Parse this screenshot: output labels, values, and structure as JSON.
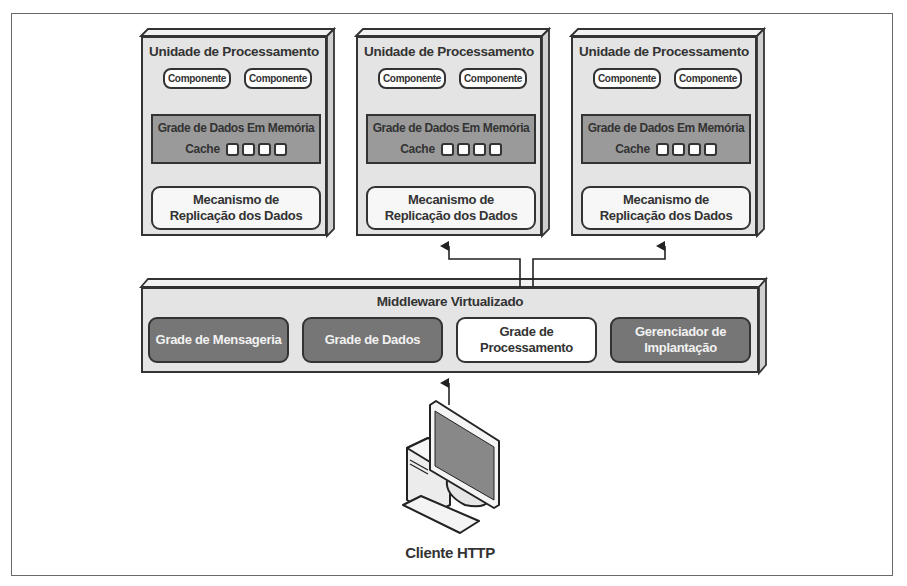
{
  "diagram": {
    "processing_units": [
      {
        "title": "Unidade de Processamento",
        "components": [
          "Componente",
          "Componente"
        ],
        "data_grid": {
          "title": "Grade de Dados Em Memória",
          "cache_label": "Cache",
          "cache_slots": 4
        },
        "replication": {
          "line1": "Mecanismo de",
          "line2": "Replicação dos Dados"
        }
      },
      {
        "title": "Unidade de Processamento",
        "components": [
          "Componente",
          "Componente"
        ],
        "data_grid": {
          "title": "Grade de Dados Em Memória",
          "cache_label": "Cache",
          "cache_slots": 4
        },
        "replication": {
          "line1": "Mecanismo de",
          "line2": "Replicação dos Dados"
        }
      },
      {
        "title": "Unidade de Processamento",
        "components": [
          "Componente",
          "Componente"
        ],
        "data_grid": {
          "title": "Grade de Dados Em Memória",
          "cache_label": "Cache",
          "cache_slots": 4
        },
        "replication": {
          "line1": "Mecanismo de",
          "line2": "Replicação dos Dados"
        }
      }
    ],
    "middleware": {
      "title": "Middleware Virtualizado",
      "modules": [
        {
          "line1": "Grade de Mensageria",
          "line2": "",
          "style": "dark"
        },
        {
          "line1": "Grade de Dados",
          "line2": "",
          "style": "dark"
        },
        {
          "line1": "Grade de",
          "line2": "Processamento",
          "style": "light"
        },
        {
          "line1": "Gerenciador de",
          "line2": "Implantação",
          "style": "dark"
        }
      ]
    },
    "client": {
      "label": "Cliente HTTP",
      "icon": "desktop-computer-icon"
    },
    "colors": {
      "unit_bg": "#e4e4e4",
      "grid_bg": "#9a9a9a",
      "module_dark": "#767676",
      "stroke": "#333333"
    }
  }
}
